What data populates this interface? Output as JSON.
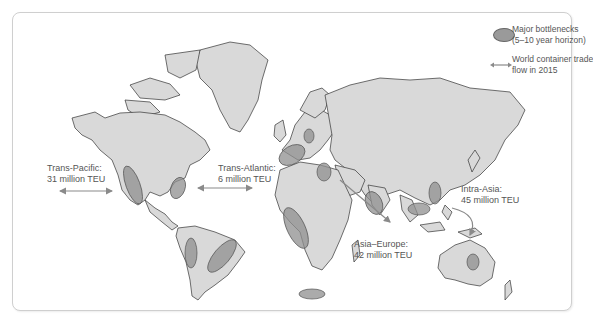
{
  "legend": {
    "bottleneck": {
      "line1": "Major bottlenecks",
      "line2": "(5–10 year horizon)",
      "icon": "ellipse-icon"
    },
    "flow": {
      "line1": "World container trade",
      "line2": "flow in 2015",
      "icon": "double-arrow-icon"
    }
  },
  "flows": {
    "trans_pacific": {
      "name": "Trans-Pacific:",
      "value": "31 million TEU"
    },
    "trans_atlantic": {
      "name": "Trans-Atlantic:",
      "value": "6 million TEU"
    },
    "intra_asia": {
      "name": "Intra-Asia:",
      "value": "45 million TEU"
    },
    "asia_europe": {
      "name": "Asia–Europe:",
      "value": "42 million TEU"
    }
  },
  "colors": {
    "land": "#d9d9d9",
    "border": "#333333",
    "bottleneck_fill": "#8f8f8f",
    "arrow": "#8a8a8a",
    "text": "#555555"
  }
}
